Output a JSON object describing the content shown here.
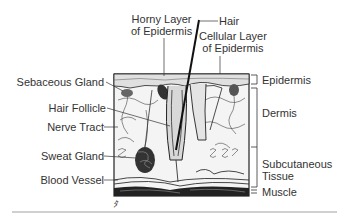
{
  "diagram": {
    "labels_left": [
      {
        "id": "sebaceous-gland",
        "text": "Sebaceous Gland"
      },
      {
        "id": "hair-follicle",
        "text": "Hair Follicle"
      },
      {
        "id": "nerve-tract",
        "text": "Nerve Tract"
      },
      {
        "id": "sweat-gland",
        "text": "Sweat Gland"
      },
      {
        "id": "blood-vessel",
        "text": "Blood Vessel"
      }
    ],
    "labels_top": {
      "horny_layer_line1": "Horny Layer",
      "horny_layer_line2": "of Epidermis",
      "hair": "Hair",
      "cellular_layer_line1": "Cellular Layer",
      "cellular_layer_line2": "of Epidermis"
    },
    "labels_right": {
      "epidermis": "Epidermis",
      "dermis": "Dermis",
      "subcutaneous_line1": "Subcutaneous",
      "subcutaneous_line2": "Tissue",
      "muscle": "Muscle"
    },
    "signature": "ﾀ"
  },
  "colors": {
    "ink": "#222222",
    "label": "#333333",
    "background": "#ffffff",
    "rule": "#888888"
  }
}
